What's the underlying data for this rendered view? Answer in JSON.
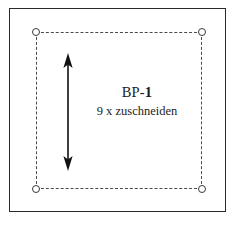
{
  "document": {
    "kind": "sewing-pattern-piece",
    "language": "de"
  },
  "frame": {
    "border_color": "#2b2b2b",
    "background": "#ffffff"
  },
  "cut_line": {
    "style": "dashed",
    "color": "#4a4a4a",
    "corner_markers": 4
  },
  "grain_arrow": {
    "orientation": "vertical",
    "heads": "double",
    "color": "#111111"
  },
  "labels": {
    "piece_prefix": "BP-",
    "piece_number": "1",
    "quantity_note": "9 x zuschneiden"
  }
}
